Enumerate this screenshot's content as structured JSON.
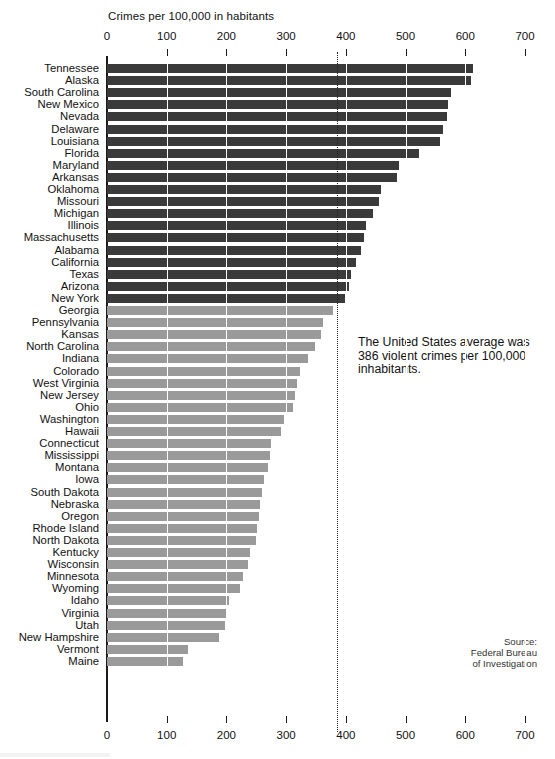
{
  "chart_data": {
    "type": "bar",
    "orientation": "horizontal",
    "title": "Crimes per 100,000 in habitants",
    "xlabel": "",
    "ylabel": "",
    "xlim": [
      0,
      700
    ],
    "xticks": [
      0,
      100,
      200,
      300,
      400,
      500,
      600,
      700
    ],
    "grid": true,
    "grid_axis": "x",
    "legend": "none",
    "colors": {
      "above_average": "#3a3a3a",
      "below_average": "#9a9a9a",
      "background": "#ffffff",
      "axis": "#1a1a1a"
    },
    "reference_line": {
      "value": 386,
      "label": "United States average",
      "style": "dotted"
    },
    "categories": [
      "Tennessee",
      "Alaska",
      "South Carolina",
      "New Mexico",
      "Nevada",
      "Delaware",
      "Louisiana",
      "Florida",
      "Maryland",
      "Arkansas",
      "Oklahoma",
      "Missouri",
      "Michigan",
      "Illinois",
      "Massachusetts",
      "Alabama",
      "California",
      "Texas",
      "Arizona",
      "New York",
      "Georgia",
      "Pennsylvania",
      "Kansas",
      "North Carolina",
      "Indiana",
      "Colorado",
      "West Virginia",
      "New Jersey",
      "Ohio",
      "Washington",
      "Hawaii",
      "Connecticut",
      "Mississippi",
      "Montana",
      "Iowa",
      "South Dakota",
      "Nebraska",
      "Oregon",
      "Rhode Island",
      "North Dakota",
      "Kentucky",
      "Wisconsin",
      "Minnesota",
      "Wyoming",
      "Idaho",
      "Virginia",
      "Utah",
      "New Hampshire",
      "Vermont",
      "Maine"
    ],
    "values": [
      613,
      610,
      576,
      571,
      569,
      563,
      558,
      522,
      489,
      485,
      459,
      455,
      445,
      434,
      430,
      425,
      417,
      409,
      405,
      398,
      378,
      362,
      358,
      348,
      337,
      323,
      318,
      315,
      311,
      297,
      292,
      275,
      273,
      270,
      263,
      259,
      257,
      255,
      252,
      250,
      240,
      236,
      228,
      222,
      204,
      201,
      198,
      187,
      136,
      127
    ],
    "series_labels": [
      "Violent crime rate per 100,000 inhabitants"
    ]
  },
  "annotation": {
    "text": "The United States average was 386 violent crimes per 100,000 inhabitants."
  },
  "source": {
    "line1": "Source:",
    "line2": "Federal Bureau",
    "line3": "of Investigation"
  }
}
